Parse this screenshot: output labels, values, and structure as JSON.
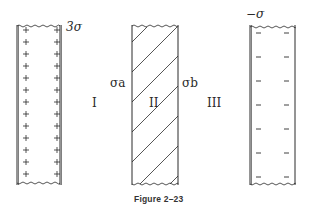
{
  "figure": {
    "caption": "Figure 2–23",
    "regions": [
      {
        "id": "I",
        "label": "I"
      },
      {
        "id": "II",
        "label": "II"
      },
      {
        "id": "III",
        "label": "III"
      }
    ],
    "slabs": [
      {
        "name": "left-slab",
        "charge_label": "3σ",
        "charge_sign": "+",
        "mark_rows": 13,
        "fill": "positive-charges"
      },
      {
        "name": "middle-slab",
        "left_surface_label": "σa",
        "right_surface_label": "σb",
        "fill": "diagonal-hatching"
      },
      {
        "name": "right-slab",
        "charge_label": "−σ",
        "charge_sign": "−",
        "mark_rows": 7,
        "fill": "negative-charges"
      }
    ]
  },
  "colors": {
    "ink": "#2a2a2a",
    "background": "#ffffff"
  }
}
